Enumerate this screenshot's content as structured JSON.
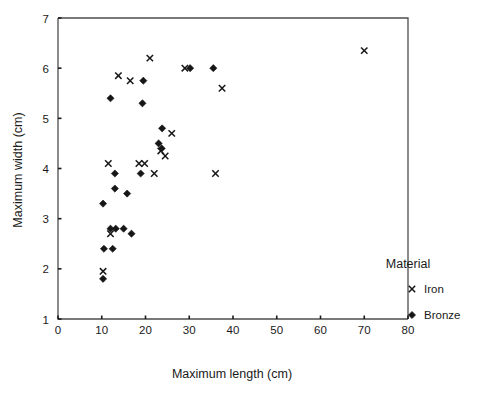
{
  "chart_data": {
    "type": "scatter",
    "title": "",
    "xlabel": "Maximum length (cm)",
    "ylabel": "Maximum width (cm)",
    "xlim": [
      0,
      80
    ],
    "ylim": [
      1,
      7
    ],
    "xticks": [
      0,
      10,
      20,
      30,
      40,
      50,
      60,
      70,
      80
    ],
    "yticks": [
      1,
      2,
      3,
      4,
      5,
      6,
      7
    ],
    "xtick_labels": [
      "0",
      "10",
      "20",
      "30",
      "40",
      "50",
      "60",
      "70",
      "80"
    ],
    "ytick_labels": [
      "1",
      "2",
      "3",
      "4",
      "5",
      "6",
      "7"
    ],
    "grid": false,
    "legend": {
      "title": "Material",
      "position": "right",
      "entries": [
        {
          "name": "Iron",
          "marker": "cross-marker",
          "color": "#161616"
        },
        {
          "name": "Bronze",
          "marker": "diamond-marker",
          "color": "#161616"
        }
      ]
    },
    "series": [
      {
        "name": "Iron",
        "marker": "cross-marker",
        "color": "#161616",
        "points": [
          [
            12.0,
            2.7
          ],
          [
            10.3,
            1.95
          ],
          [
            11.5,
            4.1
          ],
          [
            13.8,
            5.85
          ],
          [
            16.5,
            5.75
          ],
          [
            18.5,
            4.1
          ],
          [
            19.8,
            4.1
          ],
          [
            21.0,
            6.2
          ],
          [
            22.0,
            3.9
          ],
          [
            23.5,
            4.35
          ],
          [
            24.5,
            4.25
          ],
          [
            26.0,
            4.7
          ],
          [
            29.0,
            6.0
          ],
          [
            36.0,
            3.9
          ],
          [
            37.5,
            5.6
          ],
          [
            70.0,
            6.35
          ]
        ]
      },
      {
        "name": "Bronze",
        "marker": "diamond-marker",
        "color": "#161616",
        "points": [
          [
            10.3,
            1.8
          ],
          [
            10.5,
            2.4
          ],
          [
            12.5,
            2.4
          ],
          [
            12.0,
            2.8
          ],
          [
            13.2,
            2.8
          ],
          [
            15.0,
            2.8
          ],
          [
            16.8,
            2.7
          ],
          [
            10.3,
            3.3
          ],
          [
            13.0,
            3.6
          ],
          [
            13.0,
            3.9
          ],
          [
            18.9,
            3.9
          ],
          [
            19.3,
            5.3
          ],
          [
            12.0,
            5.4
          ],
          [
            19.5,
            5.75
          ],
          [
            15.8,
            3.5
          ],
          [
            23.8,
            4.8
          ],
          [
            23.0,
            4.5
          ],
          [
            23.7,
            4.4
          ],
          [
            30.2,
            6.0
          ],
          [
            35.5,
            6.0
          ]
        ]
      }
    ]
  }
}
